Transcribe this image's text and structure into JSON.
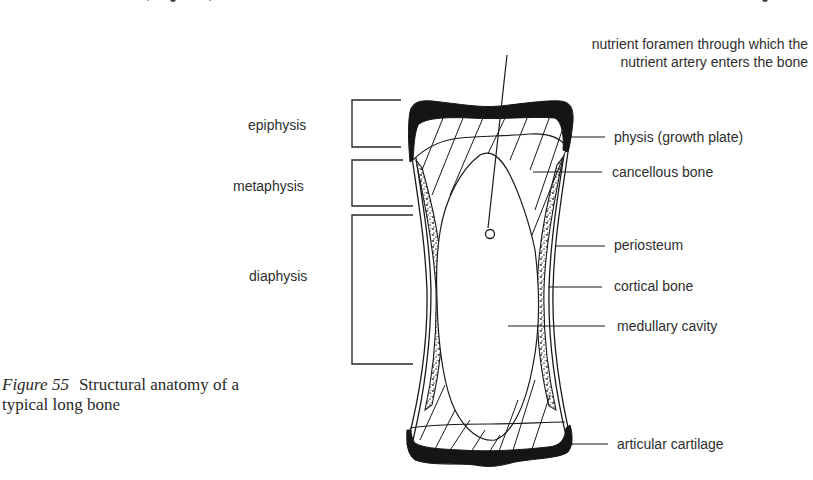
{
  "figure": {
    "number": "Figure 55",
    "caption_line1": "Structural anatomy of a",
    "caption_line2": "typical long bone"
  },
  "labels": {
    "top": {
      "line1": "nutrient foramen through which the",
      "line2": "nutrient artery enters the bone"
    },
    "left": [
      {
        "id": "epiphysis",
        "text": "epiphysis"
      },
      {
        "id": "metaphysis",
        "text": "metaphysis"
      },
      {
        "id": "diaphysis",
        "text": "diaphysis"
      }
    ],
    "right": [
      {
        "id": "physis",
        "text": "physis (growth plate)"
      },
      {
        "id": "cancellous-bone",
        "text": "cancellous bone"
      },
      {
        "id": "periosteum",
        "text": "periosteum"
      },
      {
        "id": "cortical-bone",
        "text": "cortical bone"
      },
      {
        "id": "medullary-cavity",
        "text": "medullary cavity"
      },
      {
        "id": "articular-cartilage",
        "text": "articular cartilage"
      }
    ]
  },
  "colors": {
    "ink": "#1a1a1a",
    "text": "#2e2e2e",
    "background": "#ffffff"
  }
}
